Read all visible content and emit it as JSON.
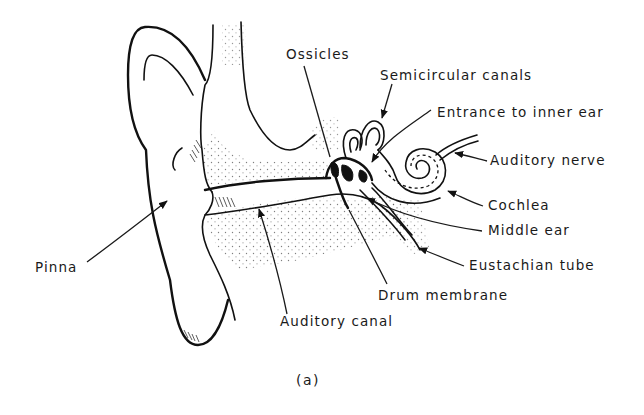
{
  "figure": {
    "caption": "(a)",
    "colors": {
      "line": "#111111",
      "background": "#ffffff",
      "stipple": "#555555"
    }
  },
  "labels": {
    "ossicles": "Ossicles",
    "semicircular_canals": "Semicircular canals",
    "entrance_inner_ear": "Entrance to inner ear",
    "auditory_nerve": "Auditory nerve",
    "cochlea": "Cochlea",
    "middle_ear": "Middle ear",
    "eustachian_tube": "Eustachian tube",
    "drum_membrane": "Drum membrane",
    "auditory_canal": "Auditory canal",
    "pinna": "Pinna"
  }
}
